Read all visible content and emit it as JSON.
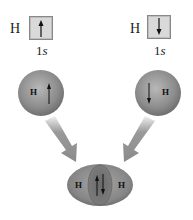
{
  "left_atom": {
    "symbol": "H",
    "orbital_number": "1",
    "orbital_letter": "s",
    "spin": "up",
    "sphere_label": "H"
  },
  "right_atom": {
    "symbol": "H",
    "orbital_number": "1",
    "orbital_letter": "s",
    "spin": "down",
    "sphere_label": "H"
  },
  "molecule": {
    "left_label": "H",
    "right_label": "H",
    "shared_spins": [
      "up",
      "down"
    ]
  },
  "colors": {
    "sphere": "#8a8a8a",
    "sphere_highlight": "#b5b5b5",
    "arrow": "#8f8f8f",
    "box_fill": "#d9d9d9",
    "overlap": "#6e6e6e"
  }
}
